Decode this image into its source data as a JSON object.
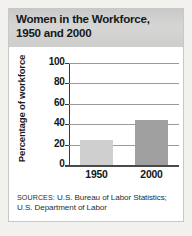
{
  "figure": {
    "title_line1": "Women in the Workforce,",
    "title_line2": "1950 and 2000",
    "sources_label": "SOURCES:",
    "sources_text": " U.S. Bureau of Labor Statistics; U.S. Department of Labor"
  },
  "colors": {
    "page_background": "#f2f1ee",
    "panel_background": "#ffffff",
    "header_band": "#d0d0ce",
    "bar_1950": "#cfcfcf",
    "bar_2000": "#a0a0a0",
    "gridline": "#9a9a9a",
    "axis": "#3a3a3a",
    "text": "#141517"
  },
  "chart_data": {
    "type": "bar",
    "title": "Women in the Workforce, 1950 and 2000",
    "categories": [
      "1950",
      "2000"
    ],
    "values": [
      25,
      44
    ],
    "series": [
      {
        "name": "Percentage of workforce",
        "values": [
          25,
          44
        ]
      }
    ],
    "xlabel": "",
    "ylabel": "Percentage of workforce",
    "ylim": [
      0,
      100
    ],
    "yticks": [
      0,
      20,
      40,
      60,
      80,
      100
    ],
    "ytick_labels": [
      "0",
      "20",
      "40",
      "60",
      "80",
      "100"
    ],
    "grid": true,
    "legend": false,
    "bar_colors": [
      "#cfcfcf",
      "#a0a0a0"
    ]
  }
}
